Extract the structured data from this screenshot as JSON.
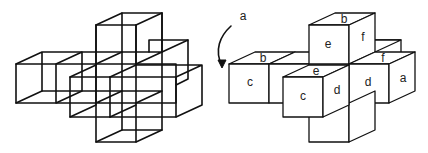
{
  "figure": {
    "left": {
      "description": "wireframe cross-shaped arrangement of cubes",
      "cube_size": 40,
      "depth_offset": [
        26,
        -12
      ]
    },
    "arrow": {
      "label": "a",
      "icon": "curved-arrow-down-left"
    },
    "right": {
      "description": "solid cube arrangement with labeled faces",
      "labels": {
        "top_cube_top": "b",
        "top_cube_front": "e",
        "top_cube_side": "f",
        "left_cube_top": "b",
        "left_cube_front": "c",
        "front_cube_top": "e",
        "front_cube_front": "c",
        "front_cube_side": "d",
        "right_cube_top": "f",
        "right_cube_front": "d",
        "right_cube_side": "a"
      }
    }
  },
  "colors": {
    "line": "#111111",
    "background": "#ffffff",
    "text": "#222222"
  }
}
